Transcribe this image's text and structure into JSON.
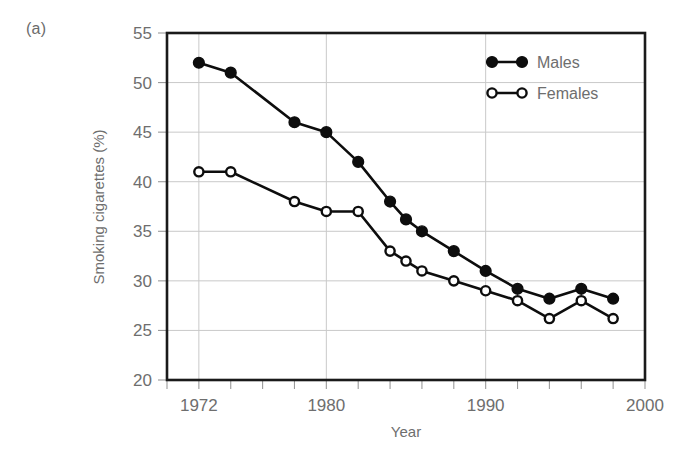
{
  "panel": {
    "label": "(a)"
  },
  "chart_data": {
    "type": "line",
    "title": "",
    "xlabel": "Year",
    "ylabel": "Smoking cigarettes (%)",
    "xlim": [
      1970,
      2000
    ],
    "ylim": [
      20,
      55
    ],
    "xticks": [
      1970,
      1972,
      1974,
      1976,
      1978,
      1980,
      1982,
      1984,
      1986,
      1988,
      1990,
      1992,
      1994,
      1996,
      1998,
      2000
    ],
    "xticklabels": [
      "",
      "1972",
      "",
      "",
      "",
      "1980",
      "",
      "",
      "",
      "",
      "1990",
      "",
      "",
      "",
      "",
      "2000"
    ],
    "yticks": [
      20,
      25,
      30,
      35,
      40,
      45,
      50,
      55
    ],
    "yticklabels": [
      "20",
      "25",
      "30",
      "35",
      "40",
      "45",
      "50",
      "55"
    ],
    "grid": true,
    "grid_axis": "both",
    "legend_position": "top-right",
    "series": [
      {
        "name": "Males",
        "marker": "filled-circle",
        "x": [
          1972,
          1974,
          1978,
          1980,
          1982,
          1984,
          1985,
          1986,
          1988,
          1990,
          1992,
          1994,
          1996,
          1998
        ],
        "values": [
          52.0,
          51.0,
          46.0,
          45.0,
          42.0,
          38.0,
          36.2,
          35.0,
          33.0,
          31.0,
          29.2,
          28.2,
          29.2,
          28.2
        ]
      },
      {
        "name": "Females",
        "marker": "open-circle",
        "x": [
          1972,
          1974,
          1978,
          1980,
          1982,
          1984,
          1985,
          1986,
          1988,
          1990,
          1992,
          1994,
          1996,
          1998
        ],
        "values": [
          41.0,
          41.0,
          38.0,
          37.0,
          37.0,
          33.0,
          32.0,
          31.0,
          30.0,
          29.0,
          28.0,
          26.2,
          28.0,
          26.2
        ]
      }
    ]
  },
  "legend": {
    "entries": [
      {
        "label": "Males"
      },
      {
        "label": "Females"
      }
    ]
  },
  "colors": {
    "line": "#0d0d0d",
    "grid": "#c9c9c9",
    "frame": "#1a1a1a",
    "text": "#6e6e6e",
    "background": "#ffffff"
  }
}
